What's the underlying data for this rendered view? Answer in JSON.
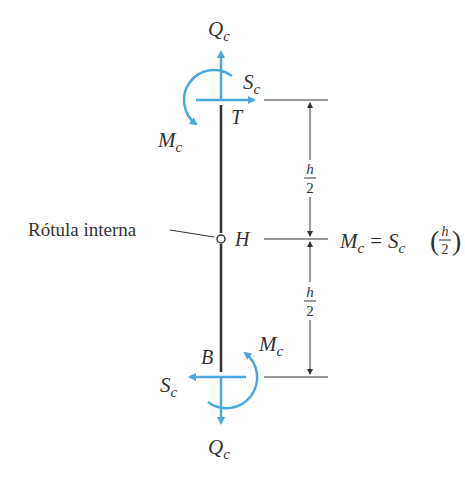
{
  "diagram": {
    "colors": {
      "force": "#4aa8dc",
      "line": "#333333",
      "text": "#333333"
    },
    "labels": {
      "top_axial": {
        "main": "Q",
        "sub": "c"
      },
      "top_shear": {
        "main": "S",
        "sub": "c"
      },
      "top_moment": {
        "main": "M",
        "sub": "c"
      },
      "top_point": "T",
      "hinge_label": "Rótula interna",
      "hinge_point": "H",
      "bottom_point": "B",
      "bottom_moment": {
        "main": "M",
        "sub": "c"
      },
      "bottom_shear": {
        "main": "S",
        "sub": "c"
      },
      "bottom_axial": {
        "main": "Q",
        "sub": "c"
      },
      "dim_upper": {
        "num": "h",
        "den": "2"
      },
      "dim_lower": {
        "num": "h",
        "den": "2"
      },
      "equation": {
        "lhs_main": "M",
        "lhs_sub": "c",
        "eq": "=",
        "rhs_main": "S",
        "rhs_sub": "c",
        "frac_num": "h",
        "frac_den": "2"
      }
    }
  }
}
